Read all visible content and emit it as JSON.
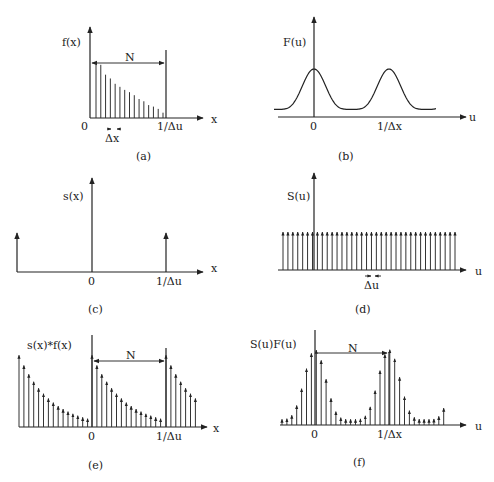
{
  "panels": {
    "a": {
      "caption": "(a)",
      "y_label": "f(x)",
      "x_label": "x",
      "tick_origin": "0",
      "tick_period": "1/Δu",
      "span_label": "N",
      "spacing_label": "Δx"
    },
    "b": {
      "caption": "(b)",
      "y_label": "F(u)",
      "x_label": "u",
      "tick_origin": "0",
      "tick_period": "1/Δx"
    },
    "c": {
      "caption": "(c)",
      "y_label": "s(x)",
      "x_label": "x",
      "tick_origin": "0",
      "tick_period": "1/Δu"
    },
    "d": {
      "caption": "(d)",
      "y_label": "S(u)",
      "x_label": "u",
      "spacing_label": "Δu"
    },
    "e": {
      "caption": "(e)",
      "y_label": "s(x)*f(x)",
      "x_label": "x",
      "tick_origin": "0",
      "tick_period": "1/Δu",
      "span_label": "N"
    },
    "f": {
      "caption": "(f)",
      "y_label": "S(u)F(u)",
      "x_label": "u",
      "tick_origin": "0",
      "tick_period": "1/Δx",
      "span_label": "N"
    }
  },
  "chart_data": [
    {
      "type": "bar",
      "title": "(a) f(x): N samples spaced Δx over one period 1/Δu",
      "xlabel": "x",
      "ylabel": "f(x)",
      "categories": [
        1,
        2,
        3,
        4,
        5,
        6,
        7,
        8,
        9,
        10,
        11,
        12,
        13,
        14,
        15
      ],
      "values": [
        0.73,
        0.7,
        0.57,
        0.52,
        0.45,
        0.41,
        0.37,
        0.34,
        0.3,
        0.25,
        0.22,
        0.17,
        0.15,
        0.12,
        0.07
      ]
    },
    {
      "type": "line",
      "title": "(b) F(u): periodic spectrum with period 1/Δx",
      "xlabel": "u",
      "ylabel": "F(u)",
      "peaks_at": [
        "0",
        "1/Δx"
      ],
      "peak_value": 0.5,
      "trough_value": 0.08
    },
    {
      "type": "bar",
      "title": "(c) s(x): impulse train with period 1/Δu",
      "xlabel": "x",
      "ylabel": "s(x)",
      "impulses_at": [
        "-1/Δu",
        "0",
        "1/Δu"
      ]
    },
    {
      "type": "bar",
      "title": "(d) S(u): impulse train with spacing Δu",
      "xlabel": "u",
      "ylabel": "S(u)",
      "impulse_count": 36,
      "equal_height": 1.0
    },
    {
      "type": "bar",
      "title": "(e) s(x)*f(x): periodic extension of sampled f(x)",
      "xlabel": "x",
      "ylabel": "s(x)*f(x)",
      "period": "1/Δu"
    },
    {
      "type": "bar",
      "title": "(f) S(u)F(u): sampled periodic spectrum",
      "xlabel": "u",
      "ylabel": "S(u)F(u)",
      "period": "1/Δx",
      "samples_per_period": "N"
    }
  ]
}
